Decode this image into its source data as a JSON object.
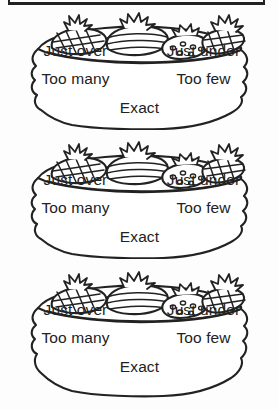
{
  "page": {
    "background_color": "#ffffff",
    "ink_color": "#222222",
    "top_rule": "horizontal-rule"
  },
  "cards": [
    {
      "id": "basket-card-1",
      "basket_label": "fruit basket",
      "fruits": [
        "pineapple",
        "melon",
        "strawberry",
        "pineapple"
      ],
      "options": {
        "just_over": "Just over",
        "just_under": "Just under",
        "too_many": "Too many",
        "too_few": "Too few",
        "exact": "Exact"
      }
    },
    {
      "id": "basket-card-2",
      "basket_label": "fruit basket",
      "fruits": [
        "pineapple",
        "melon",
        "strawberry",
        "pineapple"
      ],
      "options": {
        "just_over": "Just over",
        "just_under": "Just under",
        "too_many": "Too many",
        "too_few": "Too few",
        "exact": "Exact"
      }
    },
    {
      "id": "basket-card-3",
      "basket_label": "fruit basket",
      "fruits": [
        "pineapple",
        "melon",
        "strawberry",
        "pineapple"
      ],
      "options": {
        "just_over": "Just over",
        "just_under": "Just under",
        "too_many": "Too many",
        "too_few": "Too few",
        "exact": "Exact"
      }
    }
  ]
}
